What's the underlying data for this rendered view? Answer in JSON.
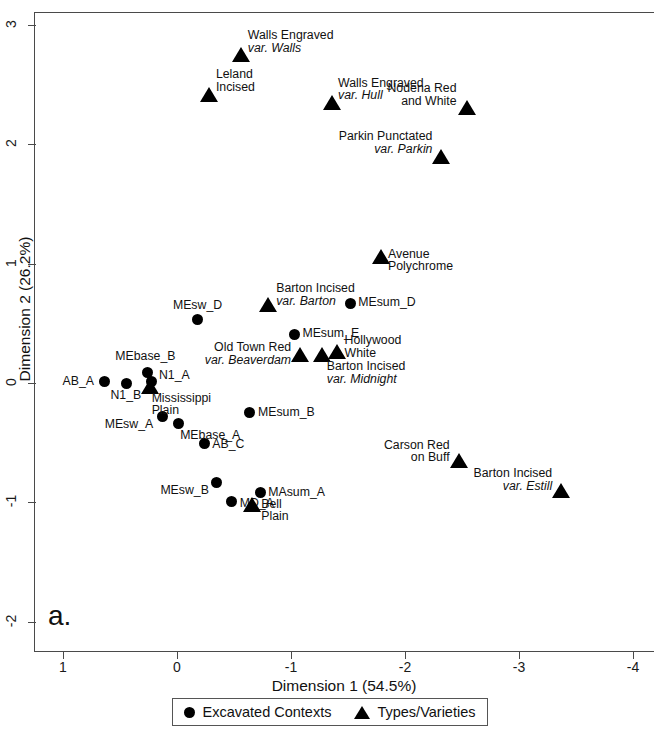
{
  "chart_data": {
    "type": "scatter",
    "title": "",
    "panel_letter": "a.",
    "xlabel": "Dimension 1 (54.5%)",
    "ylabel": "Dimension 2 (26.2%)",
    "xlim": [
      1.2,
      -4.2
    ],
    "ylim": [
      -2.2,
      3.2
    ],
    "x_ticks": [
      1,
      0,
      -1,
      -2,
      -3,
      -4
    ],
    "x_tick_labels": [
      "1",
      "0",
      "-1",
      "-2",
      "-3",
      "-4"
    ],
    "y_ticks": [
      3,
      2,
      1,
      0,
      -1,
      -2
    ],
    "y_tick_labels": [
      "3",
      "2",
      "1",
      "0",
      "-1",
      "-2"
    ],
    "x_axis_inverted": true,
    "grid": false,
    "legend_position": "bottom",
    "series": [
      {
        "name": "Excavated Contexts",
        "marker": "circle",
        "color": "#000000",
        "points": [
          {
            "label": "MEsum_D",
            "x": -1.52,
            "y": 0.67,
            "lx": 8,
            "ly": -7,
            "align": "left"
          },
          {
            "label": "MEsum_E",
            "x": -1.03,
            "y": 0.41,
            "lx": 8,
            "ly": -7,
            "align": "left"
          },
          {
            "label": "MEsw_D",
            "x": -0.18,
            "y": 0.53,
            "lx": 0,
            "ly": -21,
            "align": "center"
          },
          {
            "label": "MEbase_B",
            "x": 0.26,
            "y": 0.09,
            "lx": -2,
            "ly": -22,
            "align": "center"
          },
          {
            "label": "N1_A",
            "x": 0.22,
            "y": 0.01,
            "lx": 7,
            "ly": -13,
            "align": "left"
          },
          {
            "label": "N1_B",
            "x": 0.44,
            "y": 0.0,
            "lx": -1,
            "ly": 6,
            "align": "center"
          },
          {
            "label": "AB_A",
            "x": 0.64,
            "y": 0.01,
            "lx": -10,
            "ly": -7,
            "align": "right"
          },
          {
            "label": "MEsum_B",
            "x": -0.64,
            "y": -0.25,
            "lx": 8,
            "ly": -7,
            "align": "left"
          },
          {
            "label": "MEsw_A",
            "x": 0.13,
            "y": -0.28,
            "lx": -9,
            "ly": 2,
            "align": "right"
          },
          {
            "label": "MEbase_A",
            "x": -0.01,
            "y": -0.34,
            "lx": 2,
            "ly": 5,
            "align": "left"
          },
          {
            "label": "AB_C",
            "x": -0.24,
            "y": -0.51,
            "lx": 8,
            "ly": -6,
            "align": "left"
          },
          {
            "label": "MEsw_B",
            "x": -0.35,
            "y": -0.83,
            "lx": -8,
            "ly": 2,
            "align": "right"
          },
          {
            "label": "MD_A",
            "x": -0.48,
            "y": -0.99,
            "lx": 8,
            "ly": -4,
            "align": "left"
          },
          {
            "label": "MAsum_A",
            "x": -0.73,
            "y": -0.92,
            "lx": 8,
            "ly": -7,
            "align": "left"
          }
        ]
      },
      {
        "name": "Types/Varieties",
        "marker": "triangle",
        "color": "#000000",
        "points": [
          {
            "label": "Walls Engraved|var. Walls",
            "x": -0.56,
            "y": 2.75,
            "lx": 7,
            "ly": -26,
            "align": "left",
            "italic_lines": [
              1
            ]
          },
          {
            "label": "Leland|Incised",
            "x": -0.28,
            "y": 2.42,
            "lx": 7,
            "ly": -26,
            "align": "left",
            "italic_lines": []
          },
          {
            "label": "Walls Engraved|var. Hull",
            "x": -1.36,
            "y": 2.35,
            "lx": 6,
            "ly": -26,
            "align": "left",
            "italic_lines": [
              1
            ]
          },
          {
            "label": "Nodena Red|and White",
            "x": -2.54,
            "y": 2.31,
            "lx": -10,
            "ly": -25,
            "align": "right",
            "italic_lines": []
          },
          {
            "label": "Parkin Punctated|var. Parkin",
            "x": -2.32,
            "y": 1.9,
            "lx": -9,
            "ly": -26,
            "align": "right",
            "italic_lines": [
              1
            ]
          },
          {
            "label": "Avenue|Polychrome",
            "x": -1.79,
            "y": 1.06,
            "lx": 7,
            "ly": -9,
            "align": "left",
            "italic_lines": []
          },
          {
            "label": "Barton Incised|var. Barton",
            "x": -0.8,
            "y": 0.66,
            "lx": 8,
            "ly": -22,
            "align": "left",
            "italic_lines": [
              1
            ]
          },
          {
            "label": "Old Town Red|var. Beaverdam",
            "x": -1.08,
            "y": 0.24,
            "lx": -9,
            "ly": -13,
            "align": "right",
            "italic_lines": [
              1
            ]
          },
          {
            "label": "Barton Incised|var. Midnight",
            "x": -1.27,
            "y": 0.24,
            "lx": 5,
            "ly": 6,
            "align": "left",
            "italic_lines": [
              1
            ]
          },
          {
            "label": "Hollywood|White",
            "x": -1.4,
            "y": 0.26,
            "lx": 8,
            "ly": -18,
            "align": "left",
            "italic_lines": []
          },
          {
            "label": "Mississippi|Plain",
            "x": 0.24,
            "y": -0.03,
            "lx": 2,
            "ly": 5,
            "align": "left",
            "italic_lines": []
          },
          {
            "label": "Bell|Plain",
            "x": -0.66,
            "y": -1.02,
            "lx": 9,
            "ly": -7,
            "align": "left",
            "italic_lines": []
          },
          {
            "label": "Carson Red|on Buff",
            "x": -2.47,
            "y": -0.65,
            "lx": -9,
            "ly": -22,
            "align": "right",
            "italic_lines": []
          },
          {
            "label": "Barton Incised|var. Estill",
            "x": -3.37,
            "y": -0.9,
            "lx": -9,
            "ly": -23,
            "align": "right",
            "italic_lines": [
              1
            ]
          }
        ]
      }
    ],
    "legend": [
      {
        "marker": "circle",
        "label": "Excavated Contexts"
      },
      {
        "marker": "triangle",
        "label": "Types/Varieties"
      }
    ]
  }
}
